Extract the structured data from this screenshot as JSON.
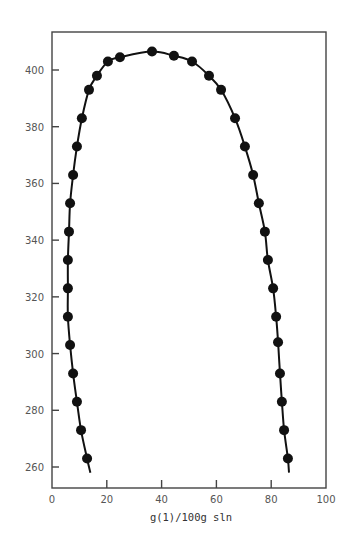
{
  "chart_data": {
    "type": "scatter",
    "title": "",
    "xlabel": "g(1)/100g sln",
    "ylabel": "",
    "xlim": [
      0,
      100
    ],
    "ylim": [
      250,
      414
    ],
    "grid": false,
    "legend": null,
    "x_ticks": [
      0,
      20,
      40,
      60,
      80,
      100
    ],
    "x_tick_labels": [
      "0",
      "20",
      "40",
      "60",
      "80",
      "100"
    ],
    "y_ticks": [
      260,
      280,
      300,
      320,
      340,
      360,
      380,
      400
    ],
    "y_tick_labels": [
      "260",
      "280",
      "300",
      "320",
      "340",
      "360",
      "380",
      "400"
    ],
    "series": [
      {
        "name": "data points with fitted curve",
        "marker": "filled-circle",
        "line": "smooth-solid",
        "points": [
          {
            "x": 12.8,
            "y": 263
          },
          {
            "x": 10.6,
            "y": 273
          },
          {
            "x": 9.1,
            "y": 283
          },
          {
            "x": 7.7,
            "y": 293
          },
          {
            "x": 6.6,
            "y": 303
          },
          {
            "x": 5.8,
            "y": 313
          },
          {
            "x": 5.8,
            "y": 323
          },
          {
            "x": 5.8,
            "y": 333
          },
          {
            "x": 6.2,
            "y": 343
          },
          {
            "x": 6.6,
            "y": 353
          },
          {
            "x": 7.7,
            "y": 363
          },
          {
            "x": 9.1,
            "y": 373
          },
          {
            "x": 10.9,
            "y": 383
          },
          {
            "x": 13.5,
            "y": 393
          },
          {
            "x": 16.4,
            "y": 398
          },
          {
            "x": 20.4,
            "y": 403
          },
          {
            "x": 24.8,
            "y": 404.5
          },
          {
            "x": 36.5,
            "y": 406.5
          },
          {
            "x": 44.5,
            "y": 405
          },
          {
            "x": 51.1,
            "y": 403
          },
          {
            "x": 57.3,
            "y": 398
          },
          {
            "x": 61.7,
            "y": 393
          },
          {
            "x": 66.8,
            "y": 383
          },
          {
            "x": 70.4,
            "y": 373
          },
          {
            "x": 73.4,
            "y": 363
          },
          {
            "x": 75.5,
            "y": 353
          },
          {
            "x": 77.7,
            "y": 343
          },
          {
            "x": 78.8,
            "y": 333
          },
          {
            "x": 80.7,
            "y": 323
          },
          {
            "x": 81.8,
            "y": 313
          },
          {
            "x": 82.5,
            "y": 304
          },
          {
            "x": 83.2,
            "y": 293
          },
          {
            "x": 83.9,
            "y": 283
          },
          {
            "x": 84.7,
            "y": 273
          },
          {
            "x": 86.1,
            "y": 263
          }
        ],
        "curve_endpoints": {
          "left_bottom": {
            "x": 14,
            "y": 258
          },
          "right_bottom": {
            "x": 86.5,
            "y": 258
          }
        }
      }
    ]
  },
  "layout": {
    "frame": {
      "left": 52,
      "top": 32,
      "right": 326,
      "bottom": 488
    },
    "x_px": {
      "min_val": 0,
      "max_val": 100,
      "min_px": 52,
      "max_px": 326
    },
    "y_px": {
      "ref1_val": 400,
      "ref1_px": 70,
      "ref2_val": 260,
      "ref2_px": 467
    },
    "colors": {
      "axis": "#444444",
      "marker": "#111111",
      "curve": "#111111",
      "text": "#555555"
    }
  }
}
